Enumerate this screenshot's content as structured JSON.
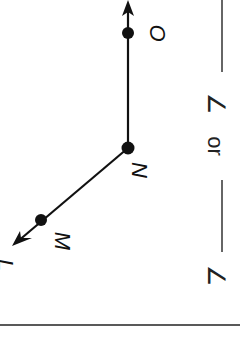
{
  "figure": {
    "rotation_deg": 90,
    "points": [
      {
        "name": "L",
        "label": "L"
      },
      {
        "name": "M",
        "label": "M"
      },
      {
        "name": "N",
        "label": "N"
      },
      {
        "name": "O",
        "label": "O"
      }
    ],
    "vertex": "N",
    "rays": [
      "NL",
      "NO"
    ]
  },
  "prompt": {
    "angle_symbol_1": "∠",
    "connector": "or",
    "angle_symbol_2": "∠"
  },
  "colors": {
    "ink": "#111111",
    "background": "#ffffff"
  }
}
